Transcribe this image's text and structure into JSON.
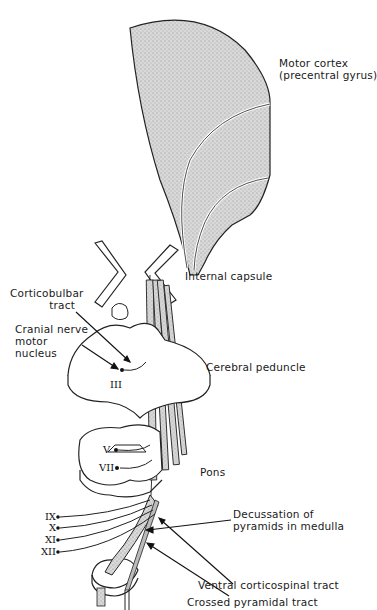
{
  "diagram": {
    "labels": {
      "motor_cortex": [
        "Motor cortex",
        "(precentral gyrus)"
      ],
      "internal_capsule": "Internal capsule",
      "corticobulbar_tract": [
        "Corticobulbar",
        "tract"
      ],
      "cranial_nerve_motor_nucleus": [
        "Cranial nerve",
        "motor",
        "nucleus"
      ],
      "cerebral_peduncle": "Cerebral peduncle",
      "pons": "Pons",
      "decussation": [
        "Decussation of",
        "pyramids in medulla"
      ],
      "ventral_corticospinal_tract": "Ventral corticospinal tract",
      "crossed_pyramidal_tract": "Crossed pyramidal tract"
    },
    "cranial_nerves": {
      "midbrain": [
        "III"
      ],
      "pons": [
        "V",
        "VII"
      ],
      "medulla": [
        "IX",
        "X",
        "XI",
        "XII"
      ]
    },
    "colors": {
      "stipple_fill": "#cfcfcf",
      "outline": "#222222",
      "background": "#ffffff"
    }
  }
}
